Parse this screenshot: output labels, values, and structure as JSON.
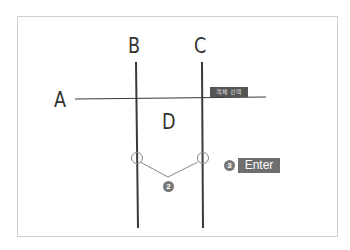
{
  "diagram": {
    "labels": {
      "a": "A",
      "b": "B",
      "c": "C",
      "d": "D"
    },
    "tooltip_tag": "객체 선택",
    "steps": {
      "step2": "2",
      "step3": "3",
      "enter_key": "Enter"
    },
    "colors": {
      "line": "#3a3a3a",
      "frame": "#cfcfcf",
      "badge": "#777777",
      "enter_bg": "#6e6e6e",
      "tag_bg": "#555555"
    }
  }
}
